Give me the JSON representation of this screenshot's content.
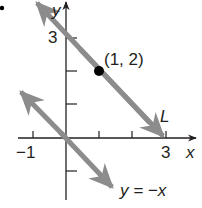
{
  "figure": {
    "marker_dot": "•",
    "axes": {
      "x_label": "x",
      "y_label": "y",
      "x_tick_labels": [
        "−1",
        "3"
      ],
      "y_tick_labels": [
        "3"
      ]
    },
    "point": {
      "label": "(1, 2)",
      "x": 1,
      "y": 2
    },
    "lines": [
      {
        "name": "L",
        "label": "L",
        "slope": -1,
        "intercept": 3,
        "color": "#8c8c8c"
      },
      {
        "name": "y = -x",
        "label": "y = −x",
        "slope": -1,
        "intercept": 0,
        "color": "#8c8c8c"
      }
    ],
    "colors": {
      "axis": "#231f20",
      "line": "#8c8c8c",
      "point": "#000000"
    }
  }
}
